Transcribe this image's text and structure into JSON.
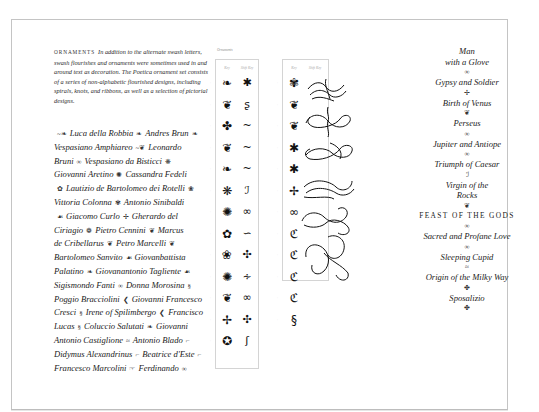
{
  "intro": {
    "heading": "ORNAMENTS",
    "body": "In addition to the alternate swash letters, swash flourishes and ornaments were sometimes used in and around text as decoration. The Poetica ornament set consists of a series of non-alphabetic flourished designs, including spirals, knots, and ribbons, as well as a selection of pictorial designs."
  },
  "names": {
    "lines": [
      [
        {
          "o": "~❧"
        },
        {
          "t": "Luca della Robbia"
        },
        {
          "o": "❧"
        },
        {
          "t": "Andres Brun"
        },
        {
          "o": "❧"
        }
      ],
      [
        {
          "t": "Vespasiano Amphiareo"
        },
        {
          "o": "~❦"
        },
        {
          "t": "Leonardo"
        }
      ],
      [
        {
          "t": "Bruni"
        },
        {
          "o": "∞"
        },
        {
          "t": "Vespasiano da Bisticci"
        },
        {
          "o": "❋"
        }
      ],
      [
        {
          "t": "Giovanni Aretino"
        },
        {
          "o": "✺"
        },
        {
          "t": "Cassandra Fedeli"
        }
      ],
      [
        {
          "o": "✿"
        },
        {
          "t": "Lautizio de Bartolomeo dei Rotelli"
        },
        {
          "o": "❀"
        }
      ],
      [
        {
          "t": "Vittoria Colonna"
        },
        {
          "o": "✾"
        },
        {
          "t": "Antonio Sinibaldi"
        }
      ],
      [
        {
          "o": "☙"
        },
        {
          "t": "Giacomo Curlo"
        },
        {
          "o": "✢"
        },
        {
          "t": "Gherardo del"
        }
      ],
      [
        {
          "t": "Ciriagio"
        },
        {
          "o": "❁"
        },
        {
          "t": "Pietro Cennini"
        },
        {
          "o": "❦"
        },
        {
          "t": "Marcus"
        }
      ],
      [
        {
          "t": "de Cribellarus"
        },
        {
          "o": "❦"
        },
        {
          "t": "Petro Marcelli"
        },
        {
          "o": "❦"
        }
      ],
      [
        {
          "t": "Bartolomeo Sanvito"
        },
        {
          "o": "☙"
        },
        {
          "t": "Giovanbattista"
        }
      ],
      [
        {
          "t": "Palatino"
        },
        {
          "o": "❧"
        },
        {
          "t": "Giovanantonio Tagliente"
        },
        {
          "o": "☙"
        }
      ],
      [
        {
          "t": "Sigismondo Fanti"
        },
        {
          "o": "∞"
        },
        {
          "t": "Donna Morosina"
        },
        {
          "o": "§"
        }
      ],
      [
        {
          "t": "Poggio Bracciolini"
        },
        {
          "o": "❮"
        },
        {
          "t": "Giovanni Francesco"
        }
      ],
      [
        {
          "t": "Cresci"
        },
        {
          "o": "§"
        },
        {
          "t": "Irene of Spilimbergo"
        },
        {
          "o": "❮"
        },
        {
          "t": "Francisco"
        }
      ],
      [
        {
          "t": "Lucas"
        },
        {
          "o": "§"
        },
        {
          "t": "Coluccio Salutati"
        },
        {
          "o": "❧"
        },
        {
          "t": "Giovanni"
        }
      ],
      [
        {
          "t": "Antonio Castiglione"
        },
        {
          "o": "≈"
        },
        {
          "t": "Antonio Blado"
        },
        {
          "o": "⌐"
        }
      ],
      [
        {
          "t": "Didymus Alexandrinus"
        },
        {
          "o": "⌐"
        },
        {
          "t": "Beatrice d'Este"
        },
        {
          "o": "⌐"
        }
      ],
      [
        {
          "t": "Francesco Marcolini"
        },
        {
          "o": "☞"
        },
        {
          "t": "Ferdinando"
        },
        {
          "o": "∞"
        }
      ]
    ]
  },
  "ornament_table": {
    "caption": "Ornaments",
    "col_headers": [
      "Key",
      "Shift Key"
    ],
    "table1": {
      "col1": [
        "❧",
        "❦",
        "✤",
        "❦",
        "❧",
        "❋",
        "✺",
        "✿",
        "❀",
        "✺",
        "❦",
        "✢",
        "✪"
      ],
      "col2": [
        "✱",
        "ʂ",
        "~",
        "~",
        "~",
        "ℐ",
        "∞",
        "∽",
        "✣",
        "∻",
        "∞",
        "✣",
        "ʃ"
      ]
    },
    "table2": {
      "col1": [
        "✾",
        "❦",
        "❦",
        "✱",
        "✱",
        "✢",
        "∞",
        "ℭ",
        "ℭ",
        "ℭ",
        "ℭ",
        "§"
      ],
      "col2": [
        "flourish",
        "flourish",
        "flourish",
        "flourish",
        "flourish",
        "flourish"
      ]
    }
  },
  "right_column": {
    "items": [
      {
        "t": "Man"
      },
      {
        "t": "with a Glove"
      },
      {
        "o": "∞"
      },
      {
        "t": "Gypsy and Soldier"
      },
      {
        "o": "✢"
      },
      {
        "t": "Birth of Venus"
      },
      {
        "o": "❦"
      },
      {
        "t": "Perseus"
      },
      {
        "o": "∞"
      },
      {
        "t": "Jupiter and Antiope"
      },
      {
        "o": "∞"
      },
      {
        "t": "Triumph of Caesar"
      },
      {
        "o": "ℐ"
      },
      {
        "t": "Virgin of the"
      },
      {
        "t": "Rocks"
      },
      {
        "o": "❦"
      },
      {
        "caps": "FEAST OF THE GODS"
      },
      {
        "o": "∞"
      },
      {
        "t": "Sacred and Profane Love"
      },
      {
        "o": "∞"
      },
      {
        "t": "Sleeping Cupid"
      },
      {
        "o": "≈"
      },
      {
        "t": "Origin of the Milky Way"
      },
      {
        "o": "✤"
      },
      {
        "t": "Sposalizio"
      },
      {
        "o": "✤"
      }
    ]
  }
}
